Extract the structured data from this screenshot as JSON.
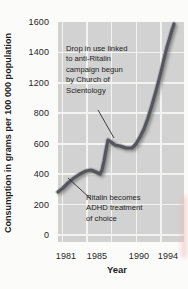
{
  "figure": {
    "y_axis_title": "Consumption in grams per 100 000 population",
    "x_axis_title": "Year",
    "y_tick_labels": [
      "1600",
      "1400",
      "1200",
      "800",
      "600",
      "400",
      "200",
      "0"
    ],
    "x_tick_labels": [
      "1981",
      "1985",
      "1990",
      "1994"
    ],
    "annotations": [
      {
        "name": "scientology-note",
        "lines": [
          "Drop in use linked",
          "to anti-Ritalin",
          "campaign begun",
          "by Church of",
          "Scientology"
        ]
      },
      {
        "name": "adhd-note",
        "lines": [
          "Ritalin becomes",
          "ADHD treatment",
          "of choice"
        ]
      }
    ]
  },
  "chart_data": {
    "type": "line",
    "title": "",
    "xlabel": "Year",
    "ylabel": "Consumption in grams per 100 000 population",
    "x_tick_values": [
      1981,
      1985,
      1990,
      1994
    ],
    "y_tick_values_as_printed": [
      0,
      200,
      400,
      600,
      800,
      1200,
      1400,
      1600
    ],
    "axis_anomaly": "printed y-axis skips 1000; the 800-to-1200 gap is drawn equal to the 200-unit gaps",
    "xlim": [
      1981,
      1995
    ],
    "grid": true,
    "legend": false,
    "series": [
      {
        "name": "Ritalin consumption",
        "points": [
          {
            "year": 1981,
            "value": 280
          },
          {
            "year": 1982,
            "value": 330
          },
          {
            "year": 1983,
            "value": 390
          },
          {
            "year": 1984,
            "value": 420
          },
          {
            "year": 1985,
            "value": 415
          },
          {
            "year": 1986,
            "value": 400
          },
          {
            "year": 1987,
            "value": 630
          },
          {
            "year": 1988,
            "value": 600
          },
          {
            "year": 1989,
            "value": 580
          },
          {
            "year": 1990,
            "value": 575
          },
          {
            "year": 1991,
            "value": 650
          },
          {
            "year": 1992,
            "value": 940
          },
          {
            "year": 1993,
            "value": 1280
          },
          {
            "year": 1994,
            "value": 1550
          }
        ]
      }
    ],
    "curve_px": [
      [
        58,
        192
      ],
      [
        63,
        188
      ],
      [
        68,
        183
      ],
      [
        74,
        178
      ],
      [
        80,
        174
      ],
      [
        86,
        171
      ],
      [
        91,
        170
      ],
      [
        96,
        172
      ],
      [
        100,
        174
      ],
      [
        102,
        170
      ],
      [
        104,
        161
      ],
      [
        106,
        150
      ],
      [
        108,
        140
      ],
      [
        111,
        142
      ],
      [
        115,
        145
      ],
      [
        120,
        146
      ],
      [
        126,
        148
      ],
      [
        132,
        148
      ],
      [
        136,
        144
      ],
      [
        140,
        137
      ],
      [
        144,
        129
      ],
      [
        148,
        118
      ],
      [
        152,
        105
      ],
      [
        156,
        91
      ],
      [
        160,
        76
      ],
      [
        164,
        59
      ],
      [
        167,
        47
      ],
      [
        170,
        37
      ],
      [
        172,
        30
      ],
      [
        174,
        24
      ]
    ],
    "pointer_lines_px": [
      {
        "x1": 98,
        "y1": 110,
        "x2": 114,
        "y2": 138
      },
      {
        "x1": 91,
        "y1": 199,
        "x2": 68,
        "y2": 178
      }
    ],
    "colors": {
      "page_bg": "#fbfbfa",
      "plot_bg": "#d2d2d2",
      "gridline": "#f3f3f2",
      "curve": "#55575c",
      "curve_glow": "#97999f",
      "pointer": "#2b2b2b",
      "text": "#1f1f1f",
      "artifact_pink": "#eeb9b6"
    }
  }
}
